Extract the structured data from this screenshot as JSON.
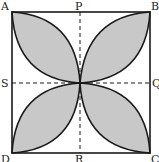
{
  "diagram": {
    "square": {
      "x1": 12,
      "y1": 12,
      "x2": 150,
      "y2": 153
    },
    "center": {
      "x": 80,
      "y": 83
    },
    "colors": {
      "shade": "#c8c8c8",
      "stroke": "#1a1a1a",
      "background": "#ffffff"
    },
    "labels": {
      "A": "A",
      "B": "B",
      "C": "C",
      "D": "D",
      "P": "P",
      "Q": "Q",
      "R": "R",
      "S": "S"
    },
    "dashed_lines": [
      "PR",
      "SQ"
    ],
    "shaded_regions": 4
  }
}
